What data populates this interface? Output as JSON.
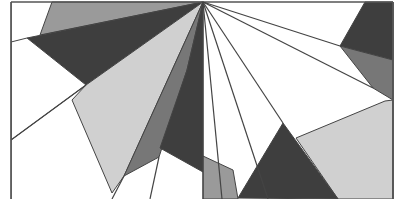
{
  "image": {
    "description": "Abstract grayscale geometric composition of polygons radiating from a focal point at top center",
    "width": 404,
    "height": 199,
    "focal_point": [
      203,
      2
    ],
    "frame": {
      "left": 11,
      "right": 393,
      "top": 2,
      "stroke": "#555555"
    },
    "colors": {
      "white": "#ffffff",
      "light_gray": "#d0d0d0",
      "medium_gray": "#9a9a9a",
      "mid_dark_gray": "#777777",
      "dark_gray": "#3e3e3e",
      "line": "#444444"
    },
    "polygons": [
      {
        "name": "top-medium-gray",
        "fill": "#9a9a9a",
        "points": "52,2 203,2 40,35"
      },
      {
        "name": "left-dark-wedge",
        "fill": "#3e3e3e",
        "points": "27,38 203,2 86,85"
      },
      {
        "name": "left-white-triangle",
        "fill": "#ffffff",
        "points": "11,42 27,38 86,85 11,140"
      },
      {
        "name": "light-gray-wedge",
        "fill": "#d0d0d0",
        "points": "203,2 86,85 72,100 112,193 124,176"
      },
      {
        "name": "mid-gray-wedge",
        "fill": "#777777",
        "points": "203,2 124,176 159,157 187,70"
      },
      {
        "name": "center-dark-wedge",
        "fill": "#3e3e3e",
        "points": "203,2 187,70 160,148 203,172"
      },
      {
        "name": "right-top-dark",
        "fill": "#3e3e3e",
        "points": "365,2 393,2 393,60 340,46"
      },
      {
        "name": "right-mid-gray",
        "fill": "#777777",
        "points": "340,46 393,60 393,100 373,88"
      },
      {
        "name": "right-light-gray",
        "fill": "#d0d0d0",
        "points": "296,138 385,101 393,100 393,199 338,199"
      },
      {
        "name": "bottom-dark",
        "fill": "#3e3e3e",
        "points": "238,198 283,123 338,199"
      },
      {
        "name": "bottom-medium-gray",
        "fill": "#9a9a9a",
        "points": "203,156 233,170 238,199 203,199"
      }
    ],
    "lines": [
      {
        "name": "frame-left",
        "points": "11,2 11,199"
      },
      {
        "name": "frame-right",
        "points": "393,2 393,199"
      },
      {
        "name": "frame-top",
        "points": "11,2 393,2"
      },
      {
        "name": "ray-1",
        "points": "203,2 222,199"
      },
      {
        "name": "ray-2",
        "points": "203,2 268,199"
      },
      {
        "name": "ray-3",
        "points": "203,2 283,123"
      },
      {
        "name": "ray-4",
        "points": "203,2 373,88"
      },
      {
        "name": "ray-5",
        "points": "203,2 340,46"
      },
      {
        "name": "ray-6",
        "points": "203,2 203,199"
      },
      {
        "name": "bottom-white-ray-left",
        "points": "124,176 112,199"
      },
      {
        "name": "bottom-white-ray-right",
        "points": "159,157 150,199"
      },
      {
        "name": "diag-left",
        "points": "11,140 86,85"
      }
    ]
  }
}
